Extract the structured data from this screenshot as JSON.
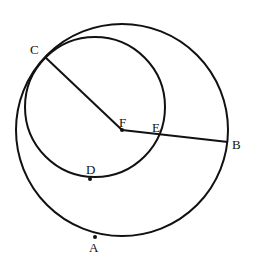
{
  "diagram": {
    "type": "geometry",
    "stroke_color": "#111111",
    "large_circle": {
      "center": "F",
      "cx": 122,
      "cy": 130,
      "r": 106
    },
    "small_circle": {
      "cx": 95,
      "cy": 107,
      "r": 70
    },
    "segments": [
      {
        "from": "C",
        "to": "F"
      },
      {
        "from": "F",
        "to": "B"
      }
    ],
    "points": [
      {
        "name": "C",
        "label": "C",
        "x": 45,
        "y": 57,
        "lx": 30,
        "ly": 54
      },
      {
        "name": "F",
        "label": "F",
        "x": 122,
        "y": 130,
        "lx": 119,
        "ly": 127
      },
      {
        "name": "E",
        "label": "E",
        "x": 161,
        "y": 133,
        "lx": 152,
        "ly": 132
      },
      {
        "name": "B",
        "label": "B",
        "x": 228,
        "y": 142,
        "lx": 232,
        "ly": 149
      },
      {
        "name": "D",
        "label": "D",
        "x": 90,
        "y": 179,
        "lx": 86,
        "ly": 174
      },
      {
        "name": "A",
        "label": "A",
        "x": 95,
        "y": 237,
        "lx": 89,
        "ly": 252
      }
    ]
  }
}
